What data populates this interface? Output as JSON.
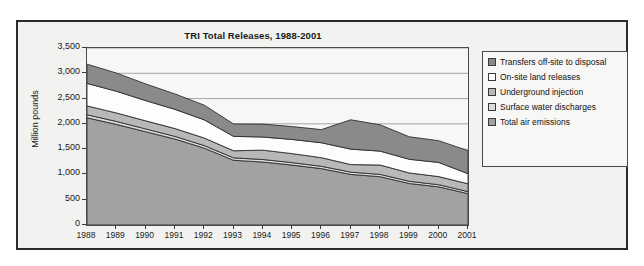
{
  "figure": {
    "title": "TRI Total Releases, 1988-2001",
    "ylabel": "Million pounds"
  },
  "legend": {
    "items": [
      {
        "label": "Transfers off-site to disposal",
        "color": "#8a8a8a",
        "key": "transfers-off-site-to-disposal"
      },
      {
        "label": "On-site land releases",
        "color": "#fdfdfd",
        "key": "on-site-land-releases"
      },
      {
        "label": "Underground injection",
        "color": "#b8b8b8",
        "key": "underground-injection"
      },
      {
        "label": "Surface water discharges",
        "color": "#dcdcdc",
        "key": "surface-water-discharges"
      },
      {
        "label": "Total air emissions",
        "color": "#a2a2a2",
        "key": "total-air-emissions"
      }
    ]
  },
  "chart_data": {
    "type": "area",
    "stacked": true,
    "title": "TRI Total Releases, 1988-2001",
    "xlabel": "",
    "ylabel": "Million pounds",
    "ylim": [
      0,
      3500
    ],
    "ytick_labels": [
      "3,500",
      "3,000",
      "2,500",
      "2,000",
      "1,500",
      "1,000",
      "500",
      "0"
    ],
    "ytick_values": [
      3500,
      3000,
      2500,
      2000,
      1500,
      1000,
      500,
      0
    ],
    "grid": true,
    "grid_axis": "y",
    "legend_position": "right",
    "categories": [
      1988,
      1989,
      1990,
      1991,
      1992,
      1993,
      1994,
      1995,
      1996,
      1997,
      1998,
      1999,
      2000,
      2001
    ],
    "xtick_labels": [
      "1988",
      "1989",
      "1990",
      "1991",
      "1992",
      "1993",
      "1994",
      "1995",
      "1996",
      "1997",
      "1998",
      "1999",
      "2000",
      "2001"
    ],
    "series": [
      {
        "name": "Total air emissions",
        "color": "#a2a2a2",
        "values": [
          2120,
          1990,
          1845,
          1700,
          1520,
          1280,
          1245,
          1185,
          1115,
          1000,
          955,
          820,
          755,
          620
        ]
      },
      {
        "name": "Surface water discharges",
        "color": "#dcdcdc",
        "values": [
          60,
          58,
          55,
          52,
          50,
          48,
          50,
          48,
          46,
          45,
          46,
          44,
          42,
          40
        ]
      },
      {
        "name": "Underground injection",
        "color": "#b8b8b8",
        "values": [
          175,
          168,
          160,
          155,
          150,
          140,
          185,
          178,
          170,
          150,
          185,
          165,
          160,
          155
        ]
      },
      {
        "name": "On-site land releases",
        "color": "#fdfdfd",
        "values": [
          445,
          430,
          400,
          380,
          360,
          285,
          260,
          280,
          295,
          305,
          275,
          270,
          280,
          200
        ]
      },
      {
        "name": "Transfers off-site to disposal",
        "color": "#8a8a8a",
        "values": [
          380,
          360,
          330,
          305,
          290,
          245,
          255,
          255,
          260,
          580,
          520,
          445,
          430,
          455
        ]
      }
    ],
    "totals": [
      3180,
      3006,
      2790,
      2592,
      2370,
      1998,
      1995,
      1946,
      1886,
      2080,
      1981,
      1744,
      1667,
      1470
    ]
  }
}
